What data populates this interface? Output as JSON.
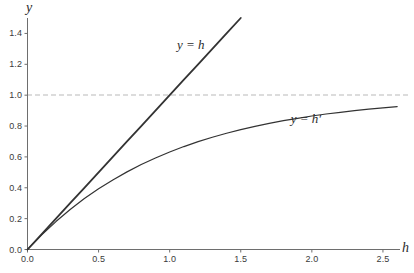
{
  "chart_data": {
    "type": "line",
    "title": "",
    "xlabel": "h",
    "ylabel": "y",
    "xlim": [
      0.0,
      2.62
    ],
    "ylim": [
      0.0,
      1.5
    ],
    "xticks": [
      "0.0",
      "0.5",
      "1.0",
      "1.5",
      "2.0",
      "2.5"
    ],
    "xtick_values": [
      0.0,
      0.5,
      1.0,
      1.5,
      2.0,
      2.5
    ],
    "yticks": [
      "0.0",
      "0.2",
      "0.4",
      "0.6",
      "0.8",
      "1.0",
      "1.2",
      "1.4"
    ],
    "ytick_values": [
      0.0,
      0.2,
      0.4,
      0.6,
      0.8,
      1.0,
      1.2,
      1.4
    ],
    "grid": false,
    "legend": "inline-annotations",
    "annotations": [
      {
        "text": "y = h",
        "x": 1.22,
        "y": 1.32
      },
      {
        "text": "y = h′",
        "x": 2.02,
        "y": 0.84
      }
    ],
    "reference_lines": [
      {
        "orientation": "horizontal",
        "y": 1.0,
        "style": "dashed",
        "color": "#b9b9b9",
        "label": ""
      }
    ],
    "series": [
      {
        "name": "y = h",
        "style": "solid",
        "color": "#333333",
        "width": 1.8,
        "x": [
          0.0,
          0.1,
          0.2,
          0.3,
          0.4,
          0.5,
          0.6,
          0.7,
          0.8,
          0.9,
          1.0,
          1.1,
          1.2,
          1.3,
          1.4,
          1.5
        ],
        "values": [
          0.0,
          0.1,
          0.2,
          0.3,
          0.4,
          0.5,
          0.6,
          0.7,
          0.8,
          0.9,
          1.0,
          1.1,
          1.2,
          1.3,
          1.4,
          1.5
        ]
      },
      {
        "name": "y = h′",
        "style": "solid",
        "color": "#333333",
        "width": 1.2,
        "x": [
          0.0,
          0.1,
          0.2,
          0.3,
          0.4,
          0.5,
          0.6,
          0.7,
          0.8,
          0.9,
          1.0,
          1.1,
          1.2,
          1.3,
          1.4,
          1.5,
          1.6,
          1.7,
          1.8,
          1.9,
          2.0,
          2.1,
          2.2,
          2.3,
          2.4,
          2.5,
          2.6
        ],
        "values": [
          0.0,
          0.095,
          0.181,
          0.259,
          0.33,
          0.393,
          0.451,
          0.503,
          0.551,
          0.593,
          0.632,
          0.667,
          0.699,
          0.727,
          0.753,
          0.777,
          0.798,
          0.817,
          0.835,
          0.85,
          0.865,
          0.878,
          0.889,
          0.9,
          0.909,
          0.918,
          0.926
        ]
      }
    ]
  },
  "axes": {
    "y_axis_name": "y",
    "x_axis_name": "h"
  }
}
